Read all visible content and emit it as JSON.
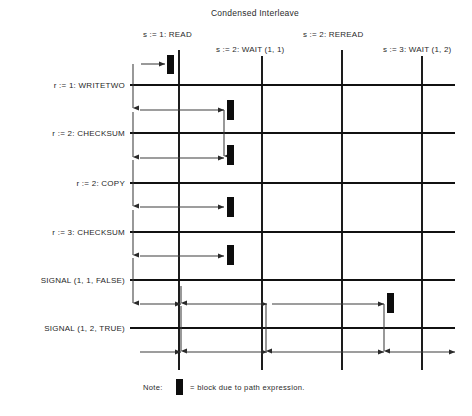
{
  "diagram": {
    "title": "Condensed Interleave",
    "type": "interleave-grid",
    "columns": [
      {
        "id": "col-read",
        "label": "s := 1: READ",
        "x": 179,
        "label_x": 143,
        "label_y": 37,
        "label_anchor": "start",
        "row_offset": 0
      },
      {
        "id": "col-wait11",
        "label": "s := 2: WAIT (1, 1)",
        "x": 262,
        "label_x": 216,
        "label_y": 52,
        "label_anchor": "start",
        "row_offset": 1
      },
      {
        "id": "col-reread",
        "label": "s := 2: REREAD",
        "x": 342,
        "label_x": 303,
        "label_y": 37,
        "label_anchor": "start",
        "row_offset": 0
      },
      {
        "id": "col-wait12",
        "label": "s := 3: WAIT (1, 2)",
        "x": 422,
        "label_x": 383,
        "label_y": 52,
        "label_anchor": "start",
        "row_offset": 1
      }
    ],
    "rows": [
      {
        "id": "row-writetwo",
        "label": "r := 1: WRITETWO",
        "y": 85,
        "label_x": 125,
        "label_y": 88
      },
      {
        "id": "row-checksum2",
        "label": "r := 2: CHECKSUM",
        "y": 133,
        "label_x": 125,
        "label_y": 136
      },
      {
        "id": "row-copy",
        "label": "r := 2: COPY",
        "y": 183,
        "label_x": 125,
        "label_y": 186
      },
      {
        "id": "row-checksum3",
        "label": "r := 3: CHECKSUM",
        "y": 232,
        "label_x": 125,
        "label_y": 235
      },
      {
        "id": "row-signal11",
        "label": "SIGNAL (1, 1, FALSE)",
        "y": 280,
        "label_x": 125,
        "label_y": 283
      },
      {
        "id": "row-signal12",
        "label": "SIGNAL (1, 2, TRUE)",
        "y": 328,
        "label_x": 125,
        "label_y": 331
      }
    ],
    "grid": {
      "h_line_x_start": 130,
      "h_line_x_end": 455,
      "v_line_y_start": 50,
      "v_line_y_end": 370,
      "lane_x": 133
    },
    "blocks": [
      {
        "id": "block-1",
        "x": 167,
        "y": 55,
        "w": 7,
        "h": 19
      },
      {
        "id": "block-2",
        "x": 227,
        "y": 100,
        "w": 7,
        "h": 20
      },
      {
        "id": "block-3",
        "x": 227,
        "y": 145,
        "w": 7,
        "h": 20
      },
      {
        "id": "block-4",
        "x": 227,
        "y": 197,
        "w": 7,
        "h": 20
      },
      {
        "id": "block-5",
        "x": 227,
        "y": 245,
        "w": 7,
        "h": 20
      },
      {
        "id": "block-6",
        "x": 387,
        "y": 293,
        "w": 7,
        "h": 20
      }
    ],
    "flows": [
      {
        "id": "flow-h-1",
        "kind": "arrow-right",
        "x1": 141,
        "y1": 64,
        "x2": 165
      },
      {
        "id": "flow-v-1",
        "kind": "arrow-down",
        "x1": 133,
        "y1": 64,
        "y2": 108
      },
      {
        "id": "flow-h-2",
        "kind": "arrow-right",
        "x1": 140,
        "y1": 110,
        "x2": 224
      },
      {
        "id": "flow-v-2",
        "kind": "arrow-down",
        "x1": 224,
        "y1": 110,
        "y2": 156
      },
      {
        "id": "flow-v-3",
        "kind": "arrow-down",
        "x1": 133,
        "y1": 112,
        "y2": 157
      },
      {
        "id": "flow-h-3",
        "kind": "arrow-right",
        "x1": 140,
        "y1": 158,
        "x2": 224
      },
      {
        "id": "flow-v-4",
        "kind": "arrow-down",
        "x1": 133,
        "y1": 160,
        "y2": 206
      },
      {
        "id": "flow-h-4",
        "kind": "arrow-right",
        "x1": 140,
        "y1": 207,
        "x2": 224
      },
      {
        "id": "flow-v-5",
        "kind": "arrow-down",
        "x1": 133,
        "y1": 210,
        "y2": 255
      },
      {
        "id": "flow-h-5",
        "kind": "arrow-right",
        "x1": 140,
        "y1": 256,
        "x2": 224
      },
      {
        "id": "flow-v-6",
        "kind": "arrow-down",
        "x1": 133,
        "y1": 258,
        "y2": 303
      },
      {
        "id": "flow-h-6a",
        "kind": "arrow-right",
        "x1": 140,
        "y1": 304,
        "x2": 181
      },
      {
        "id": "flow-v-7",
        "kind": "arrow-down",
        "x1": 181,
        "y1": 286,
        "y2": 303
      },
      {
        "id": "flow-h-6b",
        "kind": "arrow-right",
        "x1": 186,
        "y1": 304,
        "x2": 267
      },
      {
        "id": "flow-v-8",
        "kind": "arrow-down",
        "x1": 266,
        "y1": 304,
        "y2": 351
      },
      {
        "id": "flow-h-6c",
        "kind": "arrow-right",
        "x1": 272,
        "y1": 304,
        "x2": 384
      },
      {
        "id": "flow-v-9",
        "kind": "arrow-down",
        "x1": 384,
        "y1": 304,
        "y2": 351
      },
      {
        "id": "flow-v-10",
        "kind": "arrow-down",
        "x1": 181,
        "y1": 306,
        "y2": 351
      },
      {
        "id": "flow-h-7a",
        "kind": "arrow-right",
        "x1": 140,
        "y1": 352,
        "x2": 181
      },
      {
        "id": "flow-h-7b",
        "kind": "arrow-right",
        "x1": 186,
        "y1": 352,
        "x2": 267
      },
      {
        "id": "flow-h-7c",
        "kind": "arrow-right",
        "x1": 272,
        "y1": 352,
        "x2": 384
      },
      {
        "id": "flow-h-7d",
        "kind": "arrow-right",
        "x1": 390,
        "y1": 352,
        "x2": 455
      }
    ],
    "note": {
      "prefix": "Note:",
      "suffix": "= block due to path expression.",
      "prefix_x": 143,
      "glyph_x": 176,
      "glyph_y": 379,
      "glyph_w": 7,
      "glyph_h": 16,
      "suffix_x": 190,
      "text_y": 390
    },
    "colors": {
      "ink": "#111111",
      "flow": "#3c3c3c",
      "background": "#ffffff"
    }
  }
}
